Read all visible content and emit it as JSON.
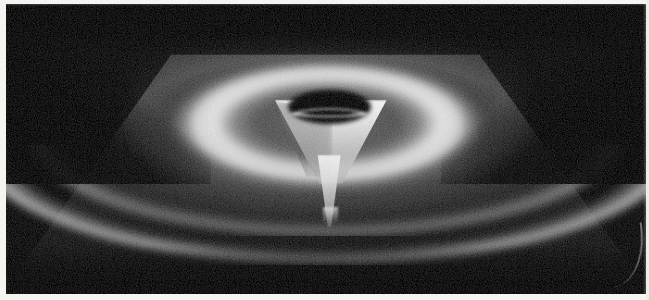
{
  "figure": {
    "kind": "photographic-plate",
    "caption_visible": false
  },
  "plate": {
    "background_color": "#050505",
    "page_color": "#f6f4f0",
    "width_px": 640,
    "height_px": 290,
    "offset_left_px": 6,
    "offset_top_px": 4,
    "has_right_edge_glow": true,
    "has_corner_curl": true
  },
  "palette": {
    "plate_black": "#050505",
    "surface_gray": "#3a3a3a",
    "ring_highlight": "#f6f6f6",
    "funnel_white": "#fcfcfc",
    "throat_black": "#000000",
    "arc_white": "#eeeeee",
    "page_white": "#f6f4f0"
  },
  "elements": {
    "base_plane": {
      "label": "ground-plane",
      "shape": "trapezoid",
      "vertices_percent": [
        [
          25.8,
          17.5
        ],
        [
          74.0,
          17.5
        ],
        [
          99.0,
          95.0
        ],
        [
          1.0,
          95.0
        ]
      ]
    },
    "ring": {
      "label": "luminous-annulus",
      "center_percent": [
        50.2,
        41.5
      ],
      "outer_radii_percent": [
        25.8,
        23.5
      ],
      "inner_radii_percent": [
        13.0,
        11.0
      ],
      "peak_brightness": "#f6f6f6"
    },
    "throat_hole": {
      "label": "throat-opening",
      "center_percent": [
        50.5,
        35.4
      ],
      "radii_percent": [
        6.5,
        5.9
      ],
      "fill": "#000000"
    },
    "funnel": {
      "label": "funnel-wall",
      "top_percent": 33.0,
      "bottom_percent": 62.0,
      "mouth_width_percent": 17.5
    },
    "spike": {
      "label": "singular-spike",
      "top_percent": 52.0,
      "tip_percent": [
        50.5,
        77.0
      ],
      "tip_pixel": [
        337,
        222
      ]
    },
    "arcs": [
      {
        "label": "front-rim-arc",
        "peak_y_percent": 80.5,
        "brightness": "#eeeeee"
      },
      {
        "label": "inner-rim-arc",
        "peak_y_percent": 66.0,
        "brightness": "#dedede"
      }
    ]
  },
  "margins": {
    "left_px": 6,
    "top_px": 4,
    "bottom_px": 6,
    "right_px": 3
  }
}
